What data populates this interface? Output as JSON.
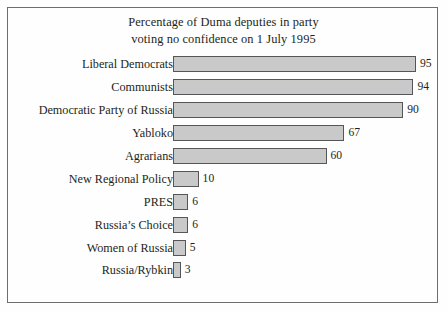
{
  "chart_data": {
    "type": "bar",
    "orientation": "horizontal",
    "title": "Percentage of Duma deputies in party voting no confidence on 1 July 1995",
    "title_lines": [
      "Percentage of Duma deputies in party",
      "voting no confidence on 1 July 1995"
    ],
    "xlabel": "",
    "ylabel": "",
    "xlim": [
      0,
      95
    ],
    "grid": false,
    "legend": false,
    "bar_fill_color": "#c9c9c9",
    "bar_border_color": "#55555a",
    "frame_color": "#6e6e6e",
    "background_color": "#fefefe",
    "text_color": "#231f20",
    "categories": [
      "Liberal Democrats",
      "Communists",
      "Democratic Party of Russia",
      "Yabloko",
      "Agrarians",
      "New Regional Policy",
      "PRES",
      "Russia’s Choice",
      "Women of Russia",
      "Russia/Rybkin"
    ],
    "values": [
      95,
      94,
      90,
      67,
      60,
      10,
      6,
      6,
      5,
      3
    ],
    "value_labels": [
      "95",
      "94",
      "90",
      "67",
      "60",
      "10",
      "6",
      "6",
      "5",
      "3"
    ],
    "bars": [
      {
        "label": "Liberal Democrats",
        "value": 95,
        "value_label": "95"
      },
      {
        "label": "Communists",
        "value": 94,
        "value_label": "94"
      },
      {
        "label": "Democratic Party of Russia",
        "value": 90,
        "value_label": "90"
      },
      {
        "label": "Yabloko",
        "value": 67,
        "value_label": "67"
      },
      {
        "label": "Agrarians",
        "value": 60,
        "value_label": "60"
      },
      {
        "label": "New Regional Policy",
        "value": 10,
        "value_label": "10"
      },
      {
        "label": "PRES",
        "value": 6,
        "value_label": "6"
      },
      {
        "label": "Russia’s Choice",
        "value": 6,
        "value_label": "6"
      },
      {
        "label": "Women of Russia",
        "value": 5,
        "value_label": "5"
      },
      {
        "label": "Russia/Rybkin",
        "value": 3,
        "value_label": "3"
      }
    ]
  }
}
